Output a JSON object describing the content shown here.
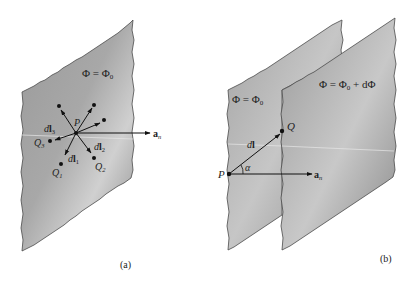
{
  "figure": {
    "panel_a": {
      "caption": "(a)",
      "surface_label": "Φ = Φ₀",
      "point_label": "P",
      "normal_label": "aₙ",
      "vectors": [
        {
          "label": "dL₁",
          "end_label": "Q₁"
        },
        {
          "label": "dL₂",
          "end_label": "Q₂"
        },
        {
          "label": "dL₃",
          "end_label": "Q₃"
        }
      ],
      "surface_label_parts": {
        "lhs": "Φ = Φ",
        "sub": "0"
      },
      "normal_parts": {
        "main": "a",
        "sub": "n"
      },
      "v1": {
        "d": "d",
        "L": "l",
        "sub": "1",
        "q": "Q",
        "qsub": "1"
      },
      "v2": {
        "d": "d",
        "L": "l",
        "sub": "2",
        "q": "Q",
        "qsub": "2"
      },
      "v3": {
        "d": "d",
        "L": "l",
        "sub": "3",
        "q": "Q",
        "qsub": "3"
      }
    },
    "panel_b": {
      "caption": "(b)",
      "back_surface_label": {
        "lhs": "Φ = Φ",
        "sub": "0"
      },
      "front_surface_label": {
        "lhs": "Φ = Φ",
        "sub": "0",
        "rhs": " + dΦ"
      },
      "point_p": "P",
      "point_q": "Q",
      "vector_label": {
        "d": "d",
        "L": "l"
      },
      "angle_label": "α",
      "normal_parts": {
        "main": "a",
        "sub": "n"
      }
    },
    "colors": {
      "plane_light": "#d2d2d2",
      "plane_dark": "#8e8e8e",
      "edge": "#555555",
      "ink": "#111111"
    }
  }
}
